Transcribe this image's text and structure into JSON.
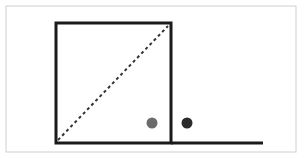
{
  "diagram": {
    "frame": {
      "x": 6,
      "y": 6,
      "w": 290,
      "h": 146,
      "stroke": "#cfcfcf"
    },
    "square": {
      "x": 56,
      "y": 23,
      "w": 115,
      "h": 120,
      "stroke": "#1a1a1a"
    },
    "ground_line": {
      "x1": 171,
      "y1": 143,
      "x2": 263,
      "y2": 143
    },
    "diagonal": {
      "x1": 58,
      "y1": 140,
      "x2": 168,
      "y2": 26
    },
    "dots": [
      {
        "name": "gray-dot",
        "cx": 152,
        "cy": 123,
        "r": 5.5,
        "fill": "#6b6b6b"
      },
      {
        "name": "dark-dot",
        "cx": 187,
        "cy": 123,
        "r": 5.5,
        "fill": "#2b2b2b"
      }
    ]
  }
}
